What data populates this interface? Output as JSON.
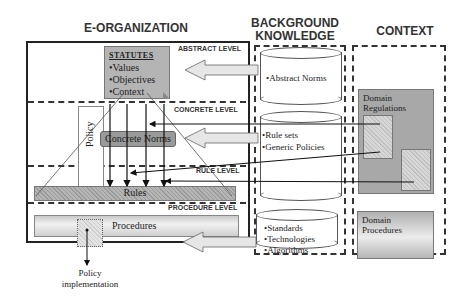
{
  "columns": {
    "e_organization": "E-ORGANIZATION",
    "background_knowledge_line1": "BACKGROUND",
    "background_knowledge_line2": "KNOWLEDGE",
    "context": "CONTEXT"
  },
  "levels": {
    "abstract": "ABSTRACT LEVEL",
    "concrete": "CONCRETE LEVEL",
    "rule": "RULE LEVEL",
    "procedure": "PROCEDURE LEVEL"
  },
  "statutes": {
    "title": "STATUTES",
    "items": [
      "•Values",
      "•Objectives",
      "•Context"
    ]
  },
  "policy_label": "Policy",
  "concrete_norms": "Concrete Norms",
  "rules": "Rules",
  "procedures": "Procedures",
  "policy_implementation": {
    "line1": "Policy",
    "line2": "implementation"
  },
  "background": {
    "cyl1": [
      "•Abstract Norms"
    ],
    "cyl2": [
      "•Rule sets",
      "•Generic Policies"
    ],
    "cyl3": [
      "•Standards",
      "•Technologies",
      "•Algorithms"
    ]
  },
  "context_items": {
    "domain_regulations_line1": "Domain",
    "domain_regulations_line2": "Regulations",
    "domain_procedures_line1": "Domain",
    "domain_procedures_line2": "Procedures"
  }
}
